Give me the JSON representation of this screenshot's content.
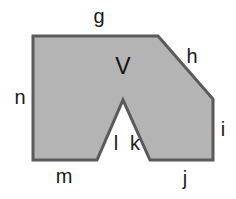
{
  "figure": {
    "name": "labeled-polygon-with-notch",
    "canvas": {
      "width": 236,
      "height": 199
    },
    "colors": {
      "background": "#ffffff",
      "fill": "#b4b4b4",
      "stroke": "#5a5a5a",
      "label": "#1a1a1a"
    },
    "stroke_width": 3,
    "outline_points": "33,36 158,36 213,99 213,160 150,160 123,100 97,160 33,160",
    "vertices": [
      {
        "name": "top-left",
        "x": 33,
        "y": 36
      },
      {
        "name": "top-right",
        "x": 158,
        "y": 36
      },
      {
        "name": "diagonal-bottom",
        "x": 213,
        "y": 99
      },
      {
        "name": "bottom-right",
        "x": 213,
        "y": 160
      },
      {
        "name": "notch-right-base",
        "x": 150,
        "y": 160
      },
      {
        "name": "notch-apex",
        "x": 123,
        "y": 100
      },
      {
        "name": "notch-left-base",
        "x": 97,
        "y": 160
      },
      {
        "name": "bottom-left",
        "x": 33,
        "y": 160
      }
    ],
    "edge_labels": [
      {
        "id": "g",
        "text": "g",
        "x": 99,
        "y": 16,
        "edge": "top"
      },
      {
        "id": "h",
        "text": "h",
        "x": 192,
        "y": 56,
        "edge": "upper-right-diagonal"
      },
      {
        "id": "i",
        "text": "i",
        "x": 223,
        "y": 129,
        "edge": "right"
      },
      {
        "id": "j",
        "text": "j",
        "x": 185,
        "y": 178,
        "edge": "bottom-right"
      },
      {
        "id": "k",
        "text": "k",
        "x": 135,
        "y": 143,
        "edge": "notch-right"
      },
      {
        "id": "l",
        "text": "l",
        "x": 116,
        "y": 143,
        "edge": "notch-left"
      },
      {
        "id": "m",
        "text": "m",
        "x": 64,
        "y": 176,
        "edge": "bottom-left"
      },
      {
        "id": "n",
        "text": "n",
        "x": 20,
        "y": 97,
        "edge": "left"
      }
    ],
    "vertex_labels": [
      {
        "id": "V",
        "text": "V",
        "x": 123,
        "y": 66
      }
    ]
  }
}
